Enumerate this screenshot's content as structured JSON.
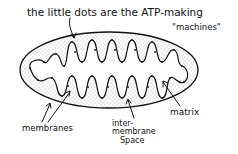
{
  "diagram": {
    "labels": {
      "dots_line1": "the little dots are the ATP-making",
      "dots_line2": "\"machines\"",
      "membranes": "membranes",
      "intermembrane_line1": "inter-",
      "intermembrane_line2": "membrane",
      "intermembrane_line3": "Space",
      "matrix": "matrix"
    },
    "colors": {
      "ink": "#111111",
      "background": "#ffffff",
      "stipple": "#555555"
    }
  }
}
